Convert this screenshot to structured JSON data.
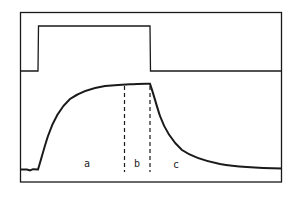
{
  "diagram": {
    "type": "stimulus-response waveform",
    "stimulus_trace": {
      "description": "rectangular pulse",
      "low_level_y": 71,
      "high_level_y": 26,
      "on_x": 38,
      "off_x": 150
    },
    "response_trace": {
      "description": "exponential rise to plateau during pulse, exponential decay after pulse",
      "baseline_y": 169,
      "plateau_y": 84
    },
    "phase_markers": [
      {
        "x": 125,
        "style": "dashed"
      },
      {
        "x": 150,
        "style": "dashed"
      }
    ],
    "labels": {
      "a": "a",
      "b": "b",
      "c": "c"
    },
    "colors": {
      "line": "#1a1a1a",
      "background": "#ffffff"
    }
  }
}
